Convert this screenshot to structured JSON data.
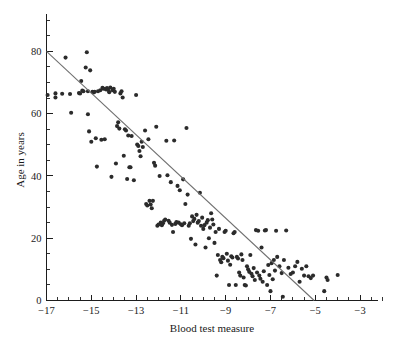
{
  "figure": {
    "background_color": "#ffffff",
    "point_color": "#2b2b2b",
    "line_color": "#6f6f6f",
    "axis_color": "#1d1d1d"
  },
  "chart_data": {
    "type": "scatter",
    "title": "",
    "xlabel": "Blood test measure",
    "ylabel": "Age in years",
    "xlim": [
      -17,
      -2.2
    ],
    "ylim": [
      0,
      92
    ],
    "grid": false,
    "legend": null,
    "x_major_ticks": [
      -17,
      -15,
      -13,
      -11,
      -9,
      -7,
      -5,
      -3
    ],
    "x_major_tick_labels": [
      "−17",
      "−15",
      "−13",
      "−11",
      "−9",
      "−7",
      "−5",
      "−3"
    ],
    "x_minor_tick_step": 0.5,
    "y_major_ticks": [
      0,
      20,
      40,
      60,
      80
    ],
    "y_major_tick_labels": [
      "0",
      "20",
      "40",
      "60",
      "80"
    ],
    "y_minor_tick_step": 5,
    "fit_line": {
      "label": "regression line",
      "x_start": -17,
      "y_start": 80,
      "x_end": -5.05,
      "y_end": 0,
      "slope": 6.69,
      "intercept": 193.8
    },
    "n_points": 196,
    "points": [
      [
        -16.95,
        66.0
      ],
      [
        -16.6,
        66.5
      ],
      [
        -16.6,
        65.2
      ],
      [
        -16.3,
        66.4
      ],
      [
        -16.15,
        78.0
      ],
      [
        -15.95,
        66.3
      ],
      [
        -15.9,
        60.3
      ],
      [
        -15.55,
        66.6
      ],
      [
        -15.5,
        66.5
      ],
      [
        -15.45,
        70.5
      ],
      [
        -15.4,
        67.4
      ],
      [
        -15.35,
        67.2
      ],
      [
        -15.25,
        74.8
      ],
      [
        -15.2,
        79.7
      ],
      [
        -15.15,
        67.2
      ],
      [
        -15.15,
        59.8
      ],
      [
        -15.1,
        54.3
      ],
      [
        -15.05,
        73.9
      ],
      [
        -15.0,
        51.0
      ],
      [
        -14.95,
        67.0
      ],
      [
        -14.9,
        66.8
      ],
      [
        -14.85,
        67.0
      ],
      [
        -14.8,
        52.1
      ],
      [
        -14.75,
        43.0
      ],
      [
        -14.7,
        67.2
      ],
      [
        -14.6,
        67.5
      ],
      [
        -14.55,
        51.6
      ],
      [
        -14.5,
        68.3
      ],
      [
        -14.45,
        68.0
      ],
      [
        -14.4,
        51.8
      ],
      [
        -14.35,
        67.8
      ],
      [
        -14.3,
        68.2
      ],
      [
        -14.25,
        67.6
      ],
      [
        -14.2,
        66.9
      ],
      [
        -14.15,
        68.4
      ],
      [
        -14.1,
        39.7
      ],
      [
        -14.05,
        67.5
      ],
      [
        -14.0,
        68.0
      ],
      [
        -13.95,
        67.0
      ],
      [
        -13.9,
        44.0
      ],
      [
        -13.85,
        56.0
      ],
      [
        -13.8,
        57.2
      ],
      [
        -13.75,
        55.2
      ],
      [
        -13.7,
        66.5
      ],
      [
        -13.65,
        67.2
      ],
      [
        -13.6,
        65.2
      ],
      [
        -13.55,
        46.5
      ],
      [
        -13.5,
        55.0
      ],
      [
        -13.45,
        54.6
      ],
      [
        -13.4,
        39.0
      ],
      [
        -13.35,
        53.0
      ],
      [
        -13.3,
        42.8
      ],
      [
        -13.25,
        42.8
      ],
      [
        -13.2,
        52.8
      ],
      [
        -13.1,
        38.6
      ],
      [
        -13.0,
        66.0
      ],
      [
        -12.95,
        50.1
      ],
      [
        -12.9,
        49.6
      ],
      [
        -12.85,
        48.0
      ],
      [
        -12.8,
        46.3
      ],
      [
        -12.75,
        51.0
      ],
      [
        -12.7,
        49.3
      ],
      [
        -12.6,
        54.6
      ],
      [
        -12.55,
        31.0
      ],
      [
        -12.5,
        30.5
      ],
      [
        -12.45,
        51.8
      ],
      [
        -12.4,
        32.0
      ],
      [
        -12.35,
        30.8
      ],
      [
        -12.3,
        29.6
      ],
      [
        -12.25,
        32.0
      ],
      [
        -12.2,
        44.2
      ],
      [
        -12.15,
        43.3
      ],
      [
        -12.1,
        55.8
      ],
      [
        -12.05,
        24.0
      ],
      [
        -12.0,
        24.4
      ],
      [
        -11.95,
        40.0
      ],
      [
        -11.9,
        25.0
      ],
      [
        -11.85,
        24.2
      ],
      [
        -11.8,
        24.8
      ],
      [
        -11.75,
        25.6
      ],
      [
        -11.7,
        26.0
      ],
      [
        -11.65,
        51.3
      ],
      [
        -11.6,
        40.2
      ],
      [
        -11.55,
        25.6
      ],
      [
        -11.5,
        25.0
      ],
      [
        -11.45,
        38.0
      ],
      [
        -11.4,
        24.3
      ],
      [
        -11.35,
        22.0
      ],
      [
        -11.3,
        51.4
      ],
      [
        -11.25,
        24.6
      ],
      [
        -11.2,
        25.2
      ],
      [
        -11.15,
        36.8
      ],
      [
        -11.1,
        25.0
      ],
      [
        -11.05,
        35.4
      ],
      [
        -11.0,
        24.5
      ],
      [
        -10.95,
        24.2
      ],
      [
        -10.9,
        38.9
      ],
      [
        -10.85,
        24.8
      ],
      [
        -10.8,
        31.0
      ],
      [
        -10.75,
        55.4
      ],
      [
        -10.7,
        34.0
      ],
      [
        -10.65,
        24.0
      ],
      [
        -10.6,
        24.8
      ],
      [
        -10.55,
        19.8
      ],
      [
        -10.5,
        27.0
      ],
      [
        -10.45,
        25.5
      ],
      [
        -10.4,
        26.2
      ],
      [
        -10.35,
        18.0
      ],
      [
        -10.3,
        27.5
      ],
      [
        -10.25,
        25.0
      ],
      [
        -10.2,
        25.5
      ],
      [
        -10.15,
        34.6
      ],
      [
        -10.1,
        24.0
      ],
      [
        -10.05,
        26.6
      ],
      [
        -10.0,
        23.0
      ],
      [
        -9.95,
        24.2
      ],
      [
        -9.9,
        17.0
      ],
      [
        -9.85,
        25.0
      ],
      [
        -9.8,
        25.8
      ],
      [
        -9.75,
        20.0
      ],
      [
        -9.7,
        23.4
      ],
      [
        -9.65,
        28.0
      ],
      [
        -9.6,
        26.0
      ],
      [
        -9.55,
        24.4
      ],
      [
        -9.5,
        18.5
      ],
      [
        -9.45,
        22.0
      ],
      [
        -9.4,
        8.0
      ],
      [
        -9.35,
        14.6
      ],
      [
        -9.3,
        23.0
      ],
      [
        -9.25,
        13.0
      ],
      [
        -9.2,
        12.3
      ],
      [
        -9.15,
        14.0
      ],
      [
        -9.1,
        13.6
      ],
      [
        -9.05,
        22.0
      ],
      [
        -9.0,
        22.4
      ],
      [
        -8.95,
        15.0
      ],
      [
        -8.9,
        12.8
      ],
      [
        -8.85,
        5.0
      ],
      [
        -8.8,
        11.5
      ],
      [
        -8.75,
        14.2
      ],
      [
        -8.7,
        13.8
      ],
      [
        -8.65,
        21.6
      ],
      [
        -8.6,
        22.0
      ],
      [
        -8.55,
        5.0
      ],
      [
        -8.5,
        14.0
      ],
      [
        -8.45,
        13.5
      ],
      [
        -8.4,
        9.0
      ],
      [
        -8.35,
        8.0
      ],
      [
        -8.3,
        14.8
      ],
      [
        -8.25,
        13.0
      ],
      [
        -8.2,
        7.4
      ],
      [
        -8.15,
        5.0
      ],
      [
        -8.1,
        4.8
      ],
      [
        -8.05,
        11.0
      ],
      [
        -8.0,
        10.0
      ],
      [
        -7.95,
        9.2
      ],
      [
        -7.9,
        14.6
      ],
      [
        -7.85,
        8.6
      ],
      [
        -7.8,
        7.8
      ],
      [
        -7.75,
        10.4
      ],
      [
        -7.7,
        6.6
      ],
      [
        -7.65,
        22.6
      ],
      [
        -7.6,
        9.0
      ],
      [
        -7.55,
        22.4
      ],
      [
        -7.5,
        8.0
      ],
      [
        -7.45,
        7.0
      ],
      [
        -7.4,
        17.0
      ],
      [
        -7.35,
        6.0
      ],
      [
        -7.3,
        9.4
      ],
      [
        -7.25,
        22.5
      ],
      [
        -7.2,
        22.6
      ],
      [
        -7.15,
        5.0
      ],
      [
        -7.1,
        11.4
      ],
      [
        -7.05,
        8.2
      ],
      [
        -7.0,
        3.0
      ],
      [
        -6.95,
        12.0
      ],
      [
        -6.9,
        6.8
      ],
      [
        -6.85,
        13.0
      ],
      [
        -6.8,
        9.6
      ],
      [
        -6.75,
        22.4
      ],
      [
        -6.7,
        14.0
      ],
      [
        -6.6,
        11.0
      ],
      [
        -6.5,
        8.8
      ],
      [
        -6.45,
        1.2
      ],
      [
        -6.4,
        13.0
      ],
      [
        -6.3,
        22.5
      ],
      [
        -6.2,
        10.5
      ],
      [
        -6.1,
        8.5
      ],
      [
        -6.0,
        9.0
      ],
      [
        -5.9,
        11.0
      ],
      [
        -5.8,
        12.4
      ],
      [
        -5.7,
        6.0
      ],
      [
        -5.6,
        10.2
      ],
      [
        -5.5,
        8.0
      ],
      [
        -5.4,
        11.0
      ],
      [
        -5.3,
        7.8
      ],
      [
        -5.2,
        7.2
      ],
      [
        -5.1,
        8.0
      ],
      [
        -4.6,
        3.0
      ],
      [
        -4.5,
        7.4
      ],
      [
        -4.45,
        6.6
      ],
      [
        -4.0,
        8.2
      ]
    ]
  }
}
